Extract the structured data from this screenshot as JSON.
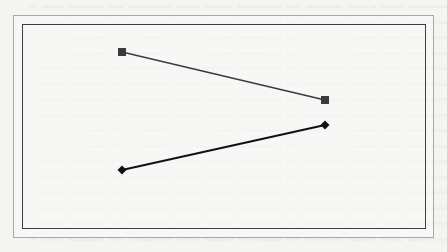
{
  "chart_data": {
    "type": "line",
    "title": "",
    "xlabel": "",
    "ylabel": "",
    "grid": false,
    "legend": null,
    "categories": [
      "A",
      "B"
    ],
    "series": [
      {
        "name": "series-square",
        "marker": "square",
        "color": "#3a3a3a",
        "points": [
          {
            "x": 122,
            "y": 52
          },
          {
            "x": 325,
            "y": 100
          }
        ]
      },
      {
        "name": "series-diamond",
        "marker": "diamond",
        "color": "#111111",
        "points": [
          {
            "x": 122,
            "y": 170
          },
          {
            "x": 325,
            "y": 125
          }
        ]
      }
    ]
  },
  "background": {
    "note": "illegible bleed-through text from reverse side of scanned page",
    "line_count": 16
  },
  "colors": {
    "page": "#f4f4f2",
    "frame_outer": "#a9a9a6",
    "frame_inner": "#3d3d3d",
    "bleed_text": "#c9c9c6"
  }
}
